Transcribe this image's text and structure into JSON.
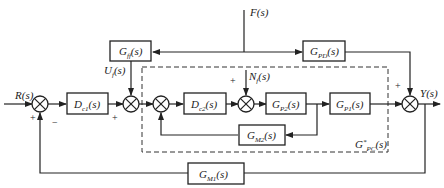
{
  "diagram": {
    "title": "",
    "signals": {
      "reference": {
        "main": "R",
        "arg": "(s)"
      },
      "output": {
        "main": "Y",
        "arg": "(s)"
      },
      "disturbance": {
        "main": "F",
        "arg": "(s)"
      },
      "feedforward_control": {
        "main": "U",
        "sub": "f",
        "arg": "(s)"
      },
      "inner_disturbance": {
        "main": "N",
        "sub": "f",
        "arg": "(s)"
      }
    },
    "blocks": {
      "outer_controller": {
        "main": "D",
        "sub": "c1",
        "arg": "(s)"
      },
      "inner_controller": {
        "main": "D",
        "sub": "c2",
        "arg": "(s)"
      },
      "feedforward": {
        "main": "G",
        "sub": "ff",
        "arg": "(s)"
      },
      "disturbance_path": {
        "main": "G",
        "sub": "PD",
        "arg": "(s)"
      },
      "inner_process": {
        "main": "G",
        "sub": "P2",
        "arg": "(s)"
      },
      "outer_process": {
        "main": "G",
        "sub": "P1",
        "arg": "(s)"
      },
      "inner_measurement": {
        "main": "G",
        "sub": "M2",
        "arg": "(s)"
      },
      "outer_measurement": {
        "main": "G",
        "sub": "M1",
        "arg": "(s)"
      }
    },
    "dashed_region_label": {
      "main": "G",
      "sup": "*",
      "sub": "PC",
      "arg": "(s)"
    },
    "signs": {
      "sum1_reference": "+",
      "sum1_feedback": "−",
      "sum2_controller": "+",
      "sum4_disturbance": "+",
      "sum5_disturbance": "+"
    }
  }
}
